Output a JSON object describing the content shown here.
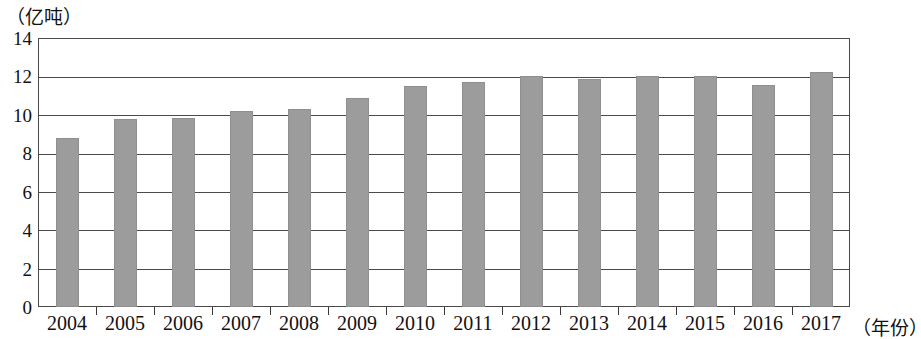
{
  "chart_data": {
    "type": "bar",
    "title": "",
    "subtitle": "",
    "xlabel": "（年份）",
    "ylabel": "（亿吨）",
    "categories": [
      "2004",
      "2005",
      "2006",
      "2007",
      "2008",
      "2009",
      "2010",
      "2011",
      "2012",
      "2013",
      "2014",
      "2015",
      "2016",
      "2017"
    ],
    "values": [
      8.8,
      9.8,
      9.85,
      10.2,
      10.3,
      10.9,
      11.5,
      11.7,
      12.0,
      11.85,
      12.0,
      12.0,
      11.55,
      12.25
    ],
    "ylim": [
      0,
      14
    ],
    "ytick_step": 2,
    "yticks": [
      "14",
      "12",
      "10",
      "8",
      "6",
      "4",
      "2",
      "0"
    ],
    "grid": true,
    "grid_orientation": "horizontal",
    "legend": null,
    "bar_color": "#9c9c9c",
    "axis_color": "#4a4a4a",
    "series": [
      {
        "name": "",
        "values": [
          8.8,
          9.8,
          9.85,
          10.2,
          10.3,
          10.9,
          11.5,
          11.7,
          12.0,
          11.85,
          12.0,
          12.0,
          11.55,
          12.25
        ]
      }
    ]
  }
}
